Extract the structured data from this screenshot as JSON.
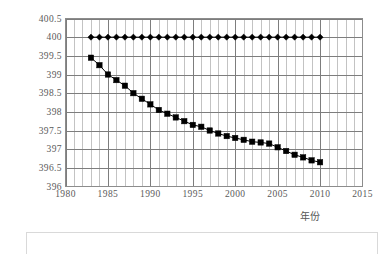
{
  "chart_data": {
    "type": "line",
    "title": "",
    "xlabel": "年份",
    "ylabel_text": "流量/(m",
    "ylabel_sup1": "3",
    "ylabel_mid": " · s",
    "ylabel_sup2": "-1",
    "ylabel_end": ")",
    "ylabel_full": "流量/(m3 · s-1)",
    "xlim": [
      1980,
      2015
    ],
    "ylim": [
      396,
      400.5
    ],
    "ytick_step": 0.5,
    "xtick_step": 5,
    "grid": true,
    "minor_x_grid_step": 1,
    "legend": "none",
    "xticks": [
      "1980",
      "1985",
      "1990",
      "1995",
      "2000",
      "2005",
      "2010",
      "2015"
    ],
    "yticks": [
      "396",
      "396.5",
      "397",
      "397.5",
      "398",
      "398.5",
      "399",
      "399.5",
      "400",
      "400.5"
    ],
    "x": [
      1983,
      1984,
      1985,
      1986,
      1987,
      1988,
      1989,
      1990,
      1991,
      1992,
      1993,
      1994,
      1995,
      1996,
      1997,
      1998,
      1999,
      2000,
      2001,
      2002,
      2003,
      2004,
      2005,
      2006,
      2007,
      2008,
      2009,
      2010
    ],
    "series": [
      {
        "name": "设计水位",
        "marker": "diamond",
        "color": "#000000",
        "values": [
          400,
          400,
          400,
          400,
          400,
          400,
          400,
          400,
          400,
          400,
          400,
          400,
          400,
          400,
          400,
          400,
          400,
          400,
          400,
          400,
          400,
          400,
          400,
          400,
          400,
          400,
          400,
          400
        ]
      },
      {
        "name": "实测流量",
        "marker": "square",
        "color": "#000000",
        "values": [
          399.45,
          399.25,
          399.0,
          398.85,
          398.7,
          398.5,
          398.35,
          398.2,
          398.05,
          397.95,
          397.85,
          397.75,
          397.65,
          397.6,
          397.5,
          397.42,
          397.35,
          397.3,
          397.25,
          397.2,
          397.18,
          397.15,
          397.05,
          396.95,
          396.85,
          396.78,
          396.7,
          396.65
        ]
      }
    ]
  }
}
